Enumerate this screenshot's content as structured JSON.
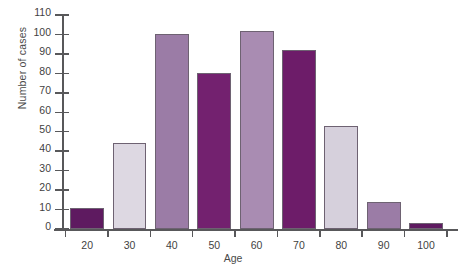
{
  "chart_data": {
    "type": "bar",
    "title": "",
    "xlabel": "Age",
    "ylabel": "Number of cases",
    "categories": [
      "20",
      "30",
      "40",
      "50",
      "60",
      "70",
      "80",
      "90",
      "100"
    ],
    "values": [
      11,
      44,
      100,
      80,
      102,
      92,
      53,
      14,
      3
    ],
    "bar_colors": [
      "#5e1a60",
      "#ddd8e2",
      "#9b7ca6",
      "#73216f",
      "#a98cb2",
      "#6d1c69",
      "#d6d0dc",
      "#9b7ca6",
      "#5e1a60"
    ],
    "ylim": [
      0,
      110
    ],
    "ytick_labels": [
      "0",
      "10",
      "20",
      "30",
      "40",
      "50",
      "60",
      "70",
      "80",
      "90",
      "100",
      "110"
    ],
    "ytick_values": [
      0,
      10,
      20,
      30,
      40,
      50,
      60,
      70,
      80,
      90,
      100,
      110
    ],
    "xtick_labels": [
      "20",
      "30",
      "40",
      "50",
      "60",
      "70",
      "80",
      "90",
      "100"
    ],
    "grid": false,
    "legend": null,
    "axis_color": "#58585a",
    "background": "#ffffff"
  }
}
